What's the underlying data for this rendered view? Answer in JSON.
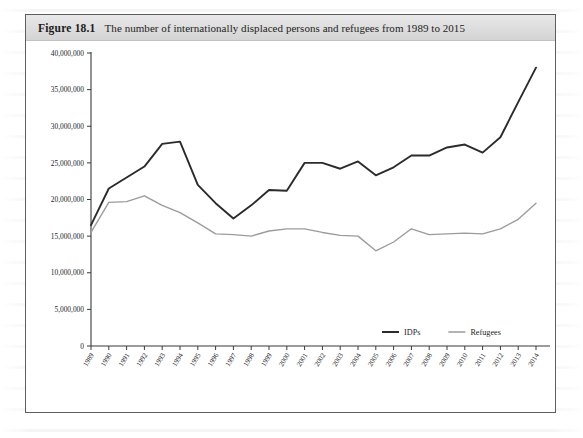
{
  "figure": {
    "label": "Figure 18.1",
    "title": "The number of internationally displaced persons and refugees from 1989 to 2015"
  },
  "colors": {
    "idps_line": "#2b2b2b",
    "refugees_line": "#9b9b9b",
    "axis": "#3a3a3a",
    "caption_bar": "#dcdcdc",
    "frame_border": "#5e5e5e",
    "page_background": "#ffffff"
  },
  "chart_data": {
    "type": "line",
    "title": "The number of internationally displaced persons and refugees from 1989 to 2015",
    "xlabel": "",
    "ylabel": "",
    "grid": false,
    "legend_position": "bottom-right-inside",
    "ylim": [
      0,
      40000000
    ],
    "ytick_values": [
      0,
      5000000,
      10000000,
      15000000,
      20000000,
      25000000,
      30000000,
      35000000,
      40000000
    ],
    "ytick_labels": [
      "0",
      "5,000,000",
      "10,000,000",
      "15,000,000",
      "20,000,000",
      "25,000,000",
      "30,000,000",
      "35,000,000",
      "40,000,000"
    ],
    "categories": [
      "1989",
      "1990",
      "1991",
      "1992",
      "1993",
      "1994",
      "1995",
      "1996",
      "1997",
      "1998",
      "1999",
      "2000",
      "2001",
      "2002",
      "2003",
      "2004",
      "2005",
      "2006",
      "2007",
      "2008",
      "2009",
      "2010",
      "2011",
      "2012",
      "2013",
      "2014"
    ],
    "series": [
      {
        "name": "IDPs",
        "color": "#2b2b2b",
        "values": [
          16500000,
          21500000,
          23000000,
          24500000,
          27600000,
          27900000,
          22000000,
          19500000,
          17400000,
          19200000,
          21300000,
          21200000,
          25000000,
          25000000,
          24200000,
          25200000,
          23300000,
          24400000,
          26000000,
          26000000,
          27100000,
          27500000,
          26400000,
          28500000,
          33300000,
          38000000
        ]
      },
      {
        "name": "Refugees",
        "color": "#9b9b9b",
        "values": [
          15500000,
          19600000,
          19700000,
          20500000,
          19200000,
          18200000,
          16800000,
          15300000,
          15200000,
          15000000,
          15700000,
          16000000,
          16000000,
          15500000,
          15100000,
          15000000,
          13000000,
          14200000,
          16000000,
          15200000,
          15300000,
          15400000,
          15300000,
          16000000,
          17300000,
          19500000
        ]
      }
    ]
  },
  "legend": {
    "items": [
      {
        "label": "IDPs",
        "color": "#2b2b2b"
      },
      {
        "label": "Refugees",
        "color": "#9b9b9b"
      }
    ]
  }
}
